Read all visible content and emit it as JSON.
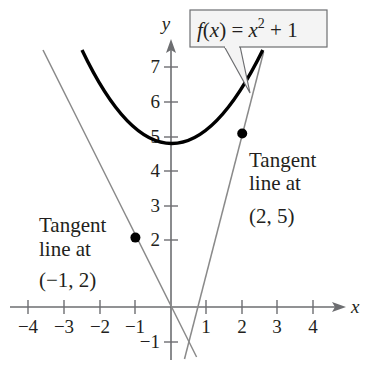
{
  "diagram": {
    "type": "function-graph-with-tangent-lines",
    "function_label": {
      "f": "f",
      "paren_open": "(",
      "x1": "x",
      "paren_close": ")",
      "equals": " = ",
      "x2": "x",
      "exponent": "2",
      "tail": " + 1"
    },
    "axes": {
      "x_name": "x",
      "y_name": "y",
      "x_ticks": [
        "−4",
        "−3",
        "−2",
        "−1",
        "1",
        "2",
        "3",
        "4"
      ],
      "y_ticks": [
        "7",
        "6",
        "5",
        "4",
        "3",
        "2",
        "−1"
      ]
    },
    "annotations": {
      "left": {
        "line1": "Tangent",
        "line2": "line at",
        "line3": "(−1, 2)"
      },
      "right": {
        "line1": "Tangent",
        "line2": "line at",
        "line3": "(2, 5)"
      }
    },
    "points": [
      {
        "x": -1,
        "y": 2,
        "label": "(−1, 2)"
      },
      {
        "x": 2,
        "y": 5,
        "label": "(2, 5)"
      }
    ],
    "curve": {
      "equation": "f(x) = x^2 + 1",
      "color": "#000000"
    },
    "tangent_lines": [
      {
        "at": "(−1, 2)",
        "equation": "y = −2x",
        "color": "#8a8a8a"
      },
      {
        "at": "(2, 5)",
        "equation": "y = 4x − 3",
        "color": "#8a8a8a"
      }
    ],
    "colors": {
      "axis": "#6d6e71",
      "curve": "#000000",
      "tangent": "#8a8a8a",
      "text": "#231f20",
      "callout_bg": "#f4f4f4",
      "callout_border": "#6d6e71"
    }
  }
}
